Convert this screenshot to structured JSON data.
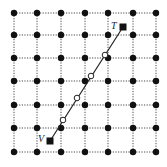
{
  "diagram": {
    "type": "grid-line-traversal",
    "grid": {
      "columns_x": [
        14,
        37,
        61,
        85,
        108,
        133,
        156
      ],
      "rows_y": [
        13,
        35,
        58,
        81,
        105,
        128,
        152
      ],
      "dot_color": "#111111",
      "line_style": "dotted"
    },
    "segment": {
      "start": {
        "label": "V",
        "x": 50,
        "y": 141
      },
      "end": {
        "label": "T",
        "x": 123,
        "y": 27
      },
      "color": "#222222"
    },
    "crossings": [
      {
        "x": 63,
        "y": 120
      },
      {
        "x": 77,
        "y": 98
      },
      {
        "x": 91,
        "y": 76
      },
      {
        "x": 105,
        "y": 55
      }
    ],
    "labels": {
      "start": "V",
      "end": "T"
    }
  }
}
